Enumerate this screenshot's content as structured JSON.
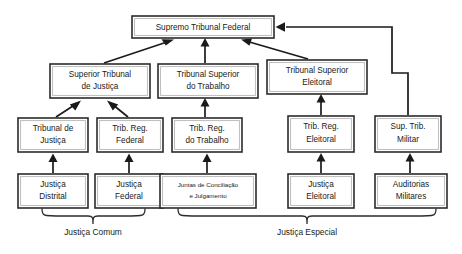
{
  "diagram": {
    "background_color": "#ffffff",
    "line_color": "#1a1a1a",
    "box_border_color": "#2b2b2b",
    "box_fill_color": "#ffffff",
    "nodes": {
      "stf": {
        "label": "Supremo Tribunal Federal",
        "x": 132,
        "y": 16,
        "w": 142,
        "h": 22
      },
      "stj": {
        "line1": "Superior Tribunal",
        "line2": "de Justiça",
        "x": 50,
        "y": 64,
        "w": 100,
        "h": 34
      },
      "tst": {
        "line1": "Tribunal Superior",
        "line2": "do Trabalho",
        "x": 158,
        "y": 64,
        "w": 100,
        "h": 34
      },
      "tse": {
        "line1": "Tribunal Superior",
        "line2": "Eleitoral",
        "x": 267,
        "y": 60,
        "w": 100,
        "h": 34
      },
      "tj": {
        "line1": "Tribunal de",
        "line2": "Justiça",
        "x": 18,
        "y": 118,
        "w": 70,
        "h": 34
      },
      "trf": {
        "line1": "Trib. Reg.",
        "line2": "Federal",
        "x": 97,
        "y": 118,
        "w": 66,
        "h": 34
      },
      "trt": {
        "line1": "Trib. Reg.",
        "line2": "do Trabalho",
        "x": 172,
        "y": 118,
        "w": 70,
        "h": 34
      },
      "tre": {
        "line1": "Trib. Reg.",
        "line2": "Eleitoral",
        "x": 288,
        "y": 116,
        "w": 66,
        "h": 36
      },
      "stm": {
        "line1": "Sup. Trib.",
        "line2": "Militar",
        "x": 375,
        "y": 116,
        "w": 66,
        "h": 36
      },
      "justica_distrital": {
        "line1": "Justiça",
        "line2": "Distrital",
        "x": 18,
        "y": 174,
        "w": 70,
        "h": 34
      },
      "justica_federal": {
        "line1": "Justiça",
        "line2": "Federal",
        "x": 95,
        "y": 174,
        "w": 68,
        "h": 34
      },
      "juntas": {
        "line1": "Juntas de Conciliação",
        "line2": "e Julgamento",
        "x": 160,
        "y": 174,
        "w": 96,
        "h": 34,
        "small": true
      },
      "justica_eleitoral": {
        "line1": "Justiça",
        "line2": "Eleitoral",
        "x": 288,
        "y": 174,
        "w": 66,
        "h": 34
      },
      "auditorias": {
        "line1": "Auditorias",
        "line2": "Militares",
        "x": 375,
        "y": 174,
        "w": 72,
        "h": 34
      }
    },
    "group_labels": [
      {
        "name": "justica-comum",
        "text": "Justiça Comum",
        "x": 93,
        "y": 233
      },
      {
        "name": "justica-especial",
        "text": "Justiça Especial",
        "x": 307,
        "y": 233
      }
    ],
    "edges": [
      {
        "from": "stj",
        "to": "stf",
        "type": "diagonal"
      },
      {
        "from": "tst",
        "to": "stf",
        "type": "vertical"
      },
      {
        "from": "tse",
        "to": "stf",
        "type": "diagonal"
      },
      {
        "from": "stm",
        "to": "stf",
        "type": "orthogonal-right"
      },
      {
        "from": "tj",
        "to": "stj",
        "type": "diagonal"
      },
      {
        "from": "trf",
        "to": "stj",
        "type": "diagonal"
      },
      {
        "from": "trt",
        "to": "tst",
        "type": "vertical"
      },
      {
        "from": "tre",
        "to": "tse",
        "type": "vertical"
      },
      {
        "from": "justica_distrital",
        "to": "tj",
        "type": "vertical"
      },
      {
        "from": "justica_federal",
        "to": "trf",
        "type": "vertical"
      },
      {
        "from": "juntas",
        "to": "trt",
        "type": "vertical"
      },
      {
        "from": "justica_eleitoral",
        "to": "tre",
        "type": "vertical"
      },
      {
        "from": "auditorias",
        "to": "stm",
        "type": "vertical"
      }
    ]
  }
}
